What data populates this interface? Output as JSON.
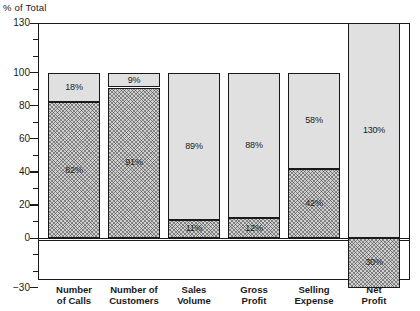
{
  "chart_data": {
    "type": "bar",
    "title": "",
    "subtitle": "",
    "ylabel": "% of Total",
    "xlabel": "",
    "ylim": [
      -30,
      130
    ],
    "yticks": [
      -30,
      0,
      20,
      40,
      60,
      80,
      100,
      130
    ],
    "ytick_labels": [
      "−30",
      "0",
      "20",
      "40",
      "60",
      "80",
      "100",
      "130"
    ],
    "minor_tick_step": 10,
    "grid": false,
    "stacked": true,
    "legend_position": "inside-bottom",
    "categories": [
      "Number of Calls",
      "Number of Customers",
      "Sales Volume",
      "Gross Profit",
      "Selling Expense",
      "Net Profit"
    ],
    "category_lines": [
      [
        "Number",
        "of Calls"
      ],
      [
        "Number of",
        "Customers"
      ],
      [
        "Sales",
        "Volume"
      ],
      [
        "Gross",
        "Profit"
      ],
      [
        "Selling",
        "Expense"
      ],
      [
        "Net",
        "Profit"
      ]
    ],
    "series": [
      {
        "name": "Profitable Customers",
        "values": [
          18,
          9,
          89,
          88,
          58,
          130
        ],
        "labels": [
          "18%",
          "9%",
          "89%",
          "88%",
          "58%",
          "130%"
        ],
        "color": "#e0e0e0",
        "pattern": "stipple"
      },
      {
        "name": "Unprofitable Customers (Less than $200 Annual Sales)",
        "values": [
          82,
          91,
          11,
          12,
          42,
          -30
        ],
        "labels": [
          "82%",
          "91%",
          "11%",
          "12%",
          "42%",
          "30%"
        ],
        "color": "#cfcfcf",
        "pattern": "crosshatch"
      }
    ],
    "annotations": [
      "Net Profit profitable segment extends to 130%",
      "Net Profit unprofitable segment extends to −30%"
    ]
  },
  "legend": {
    "items": [
      {
        "line1": "Profitable",
        "line2": "Customers",
        "swatch": "light-stipple-swatch"
      },
      {
        "line1": "Unprofitable Customers",
        "line2": "(Less than $200 Annual Sales)",
        "swatch": "dark-crosshatch-swatch"
      }
    ]
  },
  "colors": {
    "profitable_fill": "#e0e0e0",
    "unprofitable_fill": "#cfcfcf",
    "stroke": "#1a1a1a",
    "background": "#ffffff"
  }
}
